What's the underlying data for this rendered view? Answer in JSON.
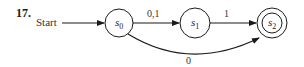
{
  "problem_number": "17.",
  "start_label": "Start",
  "states": [
    {
      "id": "s0",
      "name": "s",
      "sub": "0",
      "accepting": false
    },
    {
      "id": "s1",
      "name": "s",
      "sub": "1",
      "accepting": false
    },
    {
      "id": "s2",
      "name": "s",
      "sub": "2",
      "accepting": true
    }
  ],
  "transitions": [
    {
      "from": "s0",
      "to": "s1",
      "label": "0,1"
    },
    {
      "from": "s1",
      "to": "s2",
      "label": "1"
    },
    {
      "from": "s0",
      "to": "s2",
      "label": "0"
    }
  ],
  "colors": {
    "ink": "#1a1a1a",
    "background": "#ffffff"
  }
}
